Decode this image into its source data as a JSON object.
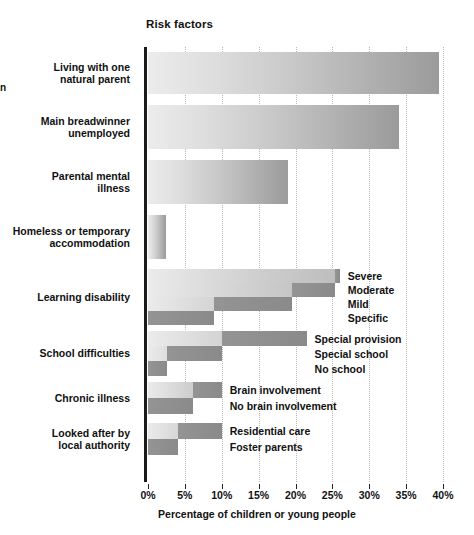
{
  "page": {
    "margin_crumb": "n"
  },
  "chart_data": {
    "type": "bar",
    "orientation": "horizontal",
    "title": "Risk factors",
    "xlabel": "Percentage of children or young people",
    "ylabel": "",
    "xlim": [
      0,
      40
    ],
    "xtick_labels": [
      "0%",
      "5%",
      "10%",
      "15%",
      "20%",
      "25%",
      "30%",
      "35%",
      "40%"
    ],
    "xtick_values": [
      0,
      5,
      10,
      15,
      20,
      25,
      30,
      35,
      40
    ],
    "grid": "vertical-dotted",
    "legend": "inline-right-of-bars",
    "categories": [
      "Living with one\nnatural parent",
      "Main breadwinner\nunemployed",
      "Parental mental\nillness",
      "Homeless or temporary\naccommodation",
      "Learning disability",
      "School difficulties",
      "Chronic illness",
      "Looked after by\nlocal authority"
    ],
    "groups": [
      {
        "name": "Living with one natural parent",
        "label": "Living with one\nnatural parent",
        "total": 39.5,
        "segments": []
      },
      {
        "name": "Main breadwinner unemployed",
        "label": "Main breadwinner\nunemployed",
        "total": 34.0,
        "segments": []
      },
      {
        "name": "Parental mental illness",
        "label": "Parental mental\nillness",
        "total": 19.0,
        "segments": []
      },
      {
        "name": "Homeless or temporary accommodation",
        "label": "Homeless or temporary\naccommodation",
        "total": 2.5,
        "segments": []
      },
      {
        "name": "Learning disability",
        "label": "Learning disability",
        "total": 26.0,
        "segments": [
          {
            "label": "Severe",
            "start": 25.3,
            "end": 26.0,
            "value": 0.7
          },
          {
            "label": "Moderate",
            "start": 19.5,
            "end": 25.3,
            "value": 5.8
          },
          {
            "label": "Mild",
            "start": 9.0,
            "end": 19.5,
            "value": 10.5
          },
          {
            "label": "Specific",
            "start": 0.0,
            "end": 9.0,
            "value": 9.0
          }
        ]
      },
      {
        "name": "School difficulties",
        "label": "School difficulties",
        "total": 21.5,
        "segments": [
          {
            "label": "Special provision",
            "start": 10.0,
            "end": 21.5,
            "value": 11.5
          },
          {
            "label": "Special school",
            "start": 2.6,
            "end": 10.0,
            "value": 7.4
          },
          {
            "label": "No school",
            "start": 0.0,
            "end": 2.6,
            "value": 2.6
          }
        ]
      },
      {
        "name": "Chronic illness",
        "label": "Chronic illness",
        "total": 10.0,
        "segments": [
          {
            "label": "Brain involvement",
            "start": 6.1,
            "end": 10.0,
            "value": 3.9
          },
          {
            "label": "No brain involvement",
            "start": 0.0,
            "end": 6.1,
            "value": 6.1
          }
        ]
      },
      {
        "name": "Looked after by local authority",
        "label": "Looked after by\nlocal authority",
        "total": 10.0,
        "segments": [
          {
            "label": "Residential care",
            "start": 4.0,
            "end": 10.0,
            "value": 6.0
          },
          {
            "label": "Foster parents",
            "start": 0.0,
            "end": 4.0,
            "value": 4.0
          }
        ]
      }
    ],
    "colors": {
      "bar_gradient_start": "#ececec",
      "bar_gradient_end": "#9b9b9b",
      "segment_dark": "#8e8e8e",
      "axis": "#1b1b1b",
      "gridline": "#b9b9b9",
      "text": "#111111",
      "background": "#ffffff"
    }
  }
}
